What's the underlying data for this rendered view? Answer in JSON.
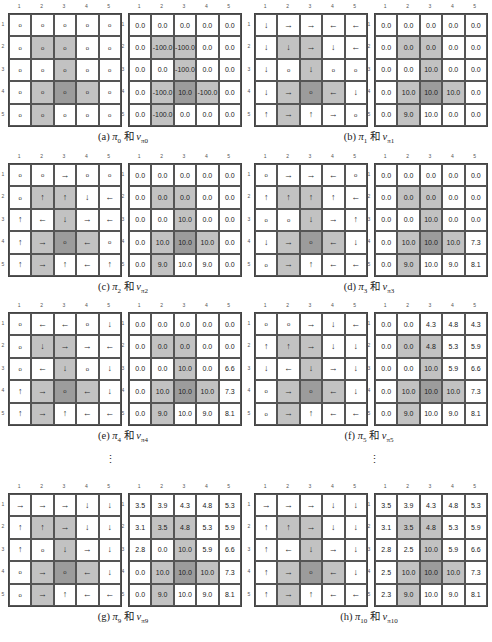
{
  "grid_size": 5,
  "column_labels": [
    "1",
    "2",
    "3",
    "4",
    "5"
  ],
  "row_labels": [
    "1",
    "2",
    "3",
    "4",
    "5"
  ],
  "colors": {
    "forbidden_cell": "#c2c2c2",
    "target_cell": "#9c9c9c",
    "normal_cell": "#ffffff"
  },
  "forbidden_cells": [
    [
      2,
      2
    ],
    [
      2,
      3
    ],
    [
      3,
      3
    ],
    [
      4,
      2
    ],
    [
      4,
      4
    ],
    [
      5,
      2
    ]
  ],
  "target_cell": [
    4,
    3
  ],
  "icon_legend": {
    "up": "↑",
    "down": "↓",
    "left": "←",
    "right": "→",
    "stay": "o"
  },
  "vertical_ellipsis": "⋮",
  "panels": [
    {
      "id": "a",
      "caption": {
        "label": "(a)",
        "policy": "π",
        "policy_sub": "0",
        "conj": "和",
        "value": "v",
        "value_sub": "π0"
      },
      "policy": [
        [
          "stay",
          "stay",
          "stay",
          "stay",
          "stay"
        ],
        [
          "stay",
          "stay",
          "stay",
          "stay",
          "stay"
        ],
        [
          "stay",
          "stay",
          "stay",
          "stay",
          "stay"
        ],
        [
          "stay",
          "stay",
          "stay",
          "stay",
          "stay"
        ],
        [
          "stay",
          "stay",
          "stay",
          "stay",
          "stay"
        ]
      ],
      "values": [
        [
          "0.0",
          "0.0",
          "0.0",
          "0.0",
          "0.0"
        ],
        [
          "0.0",
          "-100.0",
          "-100.0",
          "0.0",
          "0.0"
        ],
        [
          "0.0",
          "0.0",
          "-100.0",
          "0.0",
          "0.0"
        ],
        [
          "0.0",
          "-100.0",
          "10.0",
          "-100.0",
          "0.0"
        ],
        [
          "0.0",
          "-100.0",
          "0.0",
          "0.0",
          "0.0"
        ]
      ]
    },
    {
      "id": "b",
      "caption": {
        "label": "(b)",
        "policy": "π",
        "policy_sub": "1",
        "conj": "和",
        "value": "v",
        "value_sub": "π1"
      },
      "policy": [
        [
          "down",
          "right",
          "right",
          "left",
          "left"
        ],
        [
          "down",
          "down",
          "right",
          "down",
          "left"
        ],
        [
          "down",
          "stay",
          "down",
          "stay",
          "stay"
        ],
        [
          "down",
          "right",
          "stay",
          "left",
          "down"
        ],
        [
          "up",
          "right",
          "up",
          "right",
          "stay"
        ]
      ],
      "values": [
        [
          "0.0",
          "0.0",
          "0.0",
          "0.0",
          "0.0"
        ],
        [
          "0.0",
          "0.0",
          "0.0",
          "0.0",
          "0.0"
        ],
        [
          "0.0",
          "0.0",
          "10.0",
          "0.0",
          "0.0"
        ],
        [
          "0.0",
          "10.0",
          "10.0",
          "10.0",
          "0.0"
        ],
        [
          "0.0",
          "9.0",
          "10.0",
          "0.0",
          "0.0"
        ]
      ]
    },
    {
      "id": "c",
      "caption": {
        "label": "(c)",
        "policy": "π",
        "policy_sub": "2",
        "conj": "和",
        "value": "v",
        "value_sub": "π2"
      },
      "policy": [
        [
          "stay",
          "stay",
          "right",
          "stay",
          "stay"
        ],
        [
          "stay",
          "up",
          "up",
          "down",
          "left"
        ],
        [
          "up",
          "left",
          "down",
          "right",
          "left"
        ],
        [
          "up",
          "right",
          "stay",
          "left",
          "stay"
        ],
        [
          "up",
          "right",
          "up",
          "left",
          "up"
        ]
      ],
      "values": [
        [
          "0.0",
          "0.0",
          "0.0",
          "0.0",
          "0.0"
        ],
        [
          "0.0",
          "0.0",
          "0.0",
          "0.0",
          "0.0"
        ],
        [
          "0.0",
          "0.0",
          "10.0",
          "0.0",
          "0.0"
        ],
        [
          "0.0",
          "10.0",
          "10.0",
          "10.0",
          "0.0"
        ],
        [
          "0.0",
          "9.0",
          "10.0",
          "9.0",
          "0.0"
        ]
      ]
    },
    {
      "id": "d",
      "caption": {
        "label": "(d)",
        "policy": "π",
        "policy_sub": "3",
        "conj": "和",
        "value": "v",
        "value_sub": "π3"
      },
      "policy": [
        [
          "stay",
          "right",
          "right",
          "left",
          "stay"
        ],
        [
          "up",
          "up",
          "up",
          "up",
          "left"
        ],
        [
          "stay",
          "stay",
          "down",
          "right",
          "up"
        ],
        [
          "down",
          "right",
          "stay",
          "left",
          "down"
        ],
        [
          "stay",
          "right",
          "up",
          "left",
          "left"
        ]
      ],
      "values": [
        [
          "0.0",
          "0.0",
          "0.0",
          "0.0",
          "0.0"
        ],
        [
          "0.0",
          "0.0",
          "0.0",
          "0.0",
          "0.0"
        ],
        [
          "0.0",
          "0.0",
          "10.0",
          "0.0",
          "0.0"
        ],
        [
          "0.0",
          "10.0",
          "10.0",
          "10.0",
          "7.3"
        ],
        [
          "0.0",
          "9.0",
          "10.0",
          "9.0",
          "8.1"
        ]
      ]
    },
    {
      "id": "e",
      "caption": {
        "label": "(e)",
        "policy": "π",
        "policy_sub": "4",
        "conj": "和",
        "value": "v",
        "value_sub": "π4"
      },
      "policy": [
        [
          "stay",
          "left",
          "left",
          "stay",
          "down"
        ],
        [
          "stay",
          "down",
          "right",
          "right",
          "left"
        ],
        [
          "stay",
          "left",
          "down",
          "stay",
          "down"
        ],
        [
          "up",
          "right",
          "stay",
          "left",
          "down"
        ],
        [
          "up",
          "right",
          "up",
          "left",
          "left"
        ]
      ],
      "values": [
        [
          "0.0",
          "0.0",
          "0.0",
          "0.0",
          "0.0"
        ],
        [
          "0.0",
          "0.0",
          "0.0",
          "0.0",
          "0.0"
        ],
        [
          "0.0",
          "0.0",
          "10.0",
          "0.0",
          "6.6"
        ],
        [
          "0.0",
          "10.0",
          "10.0",
          "10.0",
          "7.3"
        ],
        [
          "0.0",
          "9.0",
          "10.0",
          "9.0",
          "8.1"
        ]
      ]
    },
    {
      "id": "f",
      "caption": {
        "label": "(f)",
        "policy": "π",
        "policy_sub": "5",
        "conj": "和",
        "value": "v",
        "value_sub": "π5"
      },
      "policy": [
        [
          "stay",
          "stay",
          "right",
          "down",
          "left"
        ],
        [
          "up",
          "up",
          "right",
          "down",
          "down"
        ],
        [
          "down",
          "left",
          "down",
          "right",
          "down"
        ],
        [
          "stay",
          "right",
          "stay",
          "left",
          "down"
        ],
        [
          "stay",
          "right",
          "up",
          "left",
          "left"
        ]
      ],
      "values": [
        [
          "0.0",
          "0.0",
          "4.3",
          "4.8",
          "4.3"
        ],
        [
          "0.0",
          "0.0",
          "4.8",
          "5.3",
          "5.9"
        ],
        [
          "0.0",
          "0.0",
          "10.0",
          "5.9",
          "6.6"
        ],
        [
          "0.0",
          "10.0",
          "10.0",
          "10.0",
          "7.3"
        ],
        [
          "0.0",
          "9.0",
          "10.0",
          "9.0",
          "8.1"
        ]
      ]
    },
    {
      "id": "g",
      "caption": {
        "label": "(g)",
        "policy": "π",
        "policy_sub": "9",
        "conj": "和",
        "value": "v",
        "value_sub": "π9"
      },
      "policy": [
        [
          "right",
          "right",
          "right",
          "down",
          "down"
        ],
        [
          "up",
          "up",
          "right",
          "down",
          "down"
        ],
        [
          "up",
          "stay",
          "down",
          "right",
          "down"
        ],
        [
          "stay",
          "right",
          "stay",
          "left",
          "down"
        ],
        [
          "stay",
          "right",
          "up",
          "left",
          "left"
        ]
      ],
      "values": [
        [
          "3.5",
          "3.9",
          "4.3",
          "4.8",
          "5.3"
        ],
        [
          "3.1",
          "3.5",
          "4.8",
          "5.3",
          "5.9"
        ],
        [
          "2.8",
          "0.0",
          "10.0",
          "5.9",
          "6.6"
        ],
        [
          "0.0",
          "10.0",
          "10.0",
          "10.0",
          "7.3"
        ],
        [
          "0.0",
          "9.0",
          "10.0",
          "9.0",
          "8.1"
        ]
      ]
    },
    {
      "id": "h",
      "caption": {
        "label": "(h)",
        "policy": "π",
        "policy_sub": "10",
        "conj": "和",
        "value": "v",
        "value_sub": "π10"
      },
      "policy": [
        [
          "right",
          "right",
          "right",
          "down",
          "down"
        ],
        [
          "up",
          "up",
          "right",
          "down",
          "down"
        ],
        [
          "up",
          "left",
          "down",
          "right",
          "down"
        ],
        [
          "up",
          "right",
          "stay",
          "left",
          "down"
        ],
        [
          "up",
          "right",
          "up",
          "left",
          "left"
        ]
      ],
      "values": [
        [
          "3.5",
          "3.9",
          "4.3",
          "4.8",
          "5.3"
        ],
        [
          "3.1",
          "3.5",
          "4.8",
          "5.3",
          "5.9"
        ],
        [
          "2.8",
          "2.5",
          "10.0",
          "5.9",
          "6.6"
        ],
        [
          "2.5",
          "10.0",
          "10.0",
          "10.0",
          "7.3"
        ],
        [
          "2.3",
          "9.0",
          "10.0",
          "9.0",
          "8.1"
        ]
      ]
    }
  ]
}
